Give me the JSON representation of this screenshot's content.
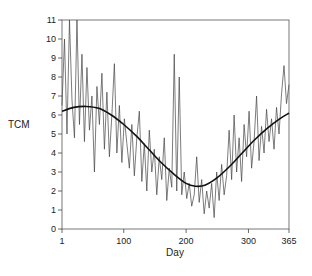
{
  "chart_data": {
    "type": "line",
    "title": "",
    "xlabel": "Day",
    "ylabel": "TCM",
    "xlim": [
      1,
      365
    ],
    "ylim": [
      0,
      11
    ],
    "xticks": [
      1,
      100,
      200,
      300,
      365
    ],
    "xtick_labels": [
      "1",
      "100",
      "200",
      "300",
      "365"
    ],
    "yticks": [
      0,
      1,
      2,
      3,
      4,
      5,
      6,
      7,
      8,
      9,
      10,
      11
    ],
    "ytick_labels": [
      "0",
      "1",
      "2",
      "3",
      "4",
      "5",
      "6",
      "7",
      "8",
      "9",
      "10",
      "11"
    ],
    "grid": false,
    "legend": "none",
    "series": [
      {
        "name": "daily",
        "style": "thin-noisy",
        "color": "#444444",
        "x": [
          1,
          5,
          9,
          13,
          17,
          21,
          25,
          29,
          33,
          37,
          41,
          45,
          49,
          53,
          57,
          61,
          65,
          69,
          73,
          77,
          81,
          85,
          89,
          93,
          97,
          101,
          105,
          109,
          113,
          117,
          121,
          125,
          129,
          133,
          137,
          141,
          145,
          149,
          153,
          157,
          161,
          165,
          169,
          173,
          177,
          181,
          185,
          189,
          193,
          197,
          201,
          205,
          209,
          213,
          217,
          221,
          225,
          229,
          233,
          237,
          241,
          245,
          249,
          253,
          257,
          261,
          265,
          269,
          273,
          277,
          281,
          285,
          289,
          293,
          297,
          301,
          305,
          309,
          313,
          317,
          321,
          325,
          329,
          333,
          337,
          341,
          345,
          349,
          353,
          357,
          361,
          365
        ],
        "values": [
          6.5,
          10.0,
          5.0,
          11.0,
          6.8,
          4.8,
          11.0,
          5.5,
          9.2,
          4.6,
          8.5,
          5.2,
          7.0,
          3.0,
          7.5,
          5.5,
          8.2,
          4.2,
          7.2,
          3.8,
          6.0,
          8.7,
          4.0,
          6.5,
          3.5,
          5.8,
          4.5,
          3.2,
          5.5,
          2.8,
          4.8,
          6.2,
          2.5,
          4.5,
          2.0,
          5.2,
          3.0,
          4.2,
          1.8,
          3.8,
          2.6,
          4.8,
          1.5,
          3.2,
          2.2,
          9.2,
          2.0,
          8.0,
          1.8,
          3.0,
          1.6,
          2.4,
          1.2,
          1.8,
          3.8,
          1.4,
          2.6,
          0.8,
          2.0,
          1.1,
          2.4,
          0.6,
          3.0,
          1.5,
          3.4,
          1.8,
          2.8,
          5.2,
          2.6,
          6.0,
          3.0,
          4.8,
          2.5,
          5.5,
          3.8,
          6.2,
          3.2,
          4.6,
          7.0,
          3.6,
          5.4,
          4.0,
          6.3,
          4.6,
          5.8,
          4.2,
          6.4,
          5.0,
          7.1,
          8.6,
          6.6,
          7.6
        ]
      },
      {
        "name": "fitted",
        "style": "smooth",
        "color": "#111111",
        "x": [
          1,
          20,
          40,
          60,
          80,
          100,
          120,
          140,
          160,
          180,
          200,
          215,
          230,
          250,
          270,
          290,
          310,
          330,
          350,
          365
        ],
        "values": [
          6.2,
          6.4,
          6.45,
          6.35,
          6.0,
          5.5,
          4.9,
          4.2,
          3.5,
          2.9,
          2.4,
          2.25,
          2.3,
          2.7,
          3.3,
          4.0,
          4.7,
          5.3,
          5.8,
          6.1
        ]
      }
    ]
  }
}
